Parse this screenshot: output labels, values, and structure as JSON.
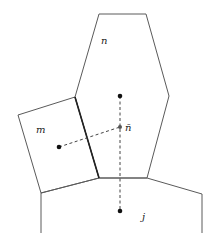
{
  "diagram": {
    "type": "mesh-cells",
    "cells": [
      {
        "id": "n",
        "label": "n",
        "shape": "hexagon"
      },
      {
        "id": "m",
        "label": "m",
        "shape": "quadrilateral"
      },
      {
        "id": "j",
        "label": "j",
        "shape": "open-polygon"
      }
    ],
    "points": [
      {
        "id": "n-center",
        "label": ""
      },
      {
        "id": "m-center",
        "label": ""
      },
      {
        "id": "j-center",
        "label": ""
      },
      {
        "id": "n-bar",
        "label": "n̄"
      }
    ],
    "labels": {
      "n": "n",
      "m": "m",
      "j": "j",
      "n_bar": "n̄"
    },
    "connections": [
      {
        "from": "m-center",
        "to": "n-bar",
        "style": "dashed"
      },
      {
        "from": "n-center",
        "to": "j-center",
        "style": "dashed"
      }
    ],
    "shared_face": {
      "between": [
        "m",
        "n"
      ],
      "style": "bold"
    }
  }
}
